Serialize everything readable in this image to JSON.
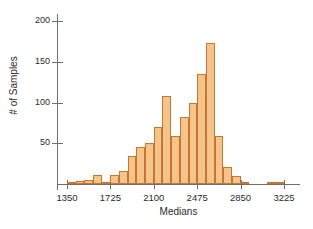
{
  "chart_data": {
    "type": "bar",
    "title": "",
    "xlabel": "Medians",
    "ylabel": "# of Samples",
    "xlim": [
      1275,
      3300
    ],
    "ylim": [
      0,
      210
    ],
    "bin_width": 75,
    "grid": false,
    "legend": null,
    "yticks": [
      50,
      100,
      150,
      200
    ],
    "ytick_labels": [
      "50",
      "100",
      "150",
      "200"
    ],
    "xticks": [
      1350,
      1725,
      2100,
      2475,
      2850,
      3225
    ],
    "xtick_labels": [
      "1350",
      "1725",
      "2100",
      "2475",
      "2850",
      "3225"
    ],
    "bin_starts": [
      1350,
      1425,
      1500,
      1575,
      1650,
      1725,
      1800,
      1875,
      1950,
      2025,
      2100,
      2175,
      2250,
      2325,
      2400,
      2475,
      2550,
      2625,
      2700,
      2775,
      2850,
      3075,
      3150
    ],
    "categories": [
      "1350",
      "1425",
      "1500",
      "1575",
      "1650",
      "1725",
      "1800",
      "1875",
      "1950",
      "2025",
      "2100",
      "2175",
      "2250",
      "2325",
      "2400",
      "2475",
      "2550",
      "2625",
      "2700",
      "2775",
      "2850",
      "3075",
      "3150"
    ],
    "values": [
      1,
      4,
      5,
      11,
      3,
      11,
      16,
      34,
      46,
      50,
      70,
      108,
      59,
      82,
      100,
      135,
      173,
      59,
      21,
      10,
      3,
      1,
      1
    ]
  }
}
